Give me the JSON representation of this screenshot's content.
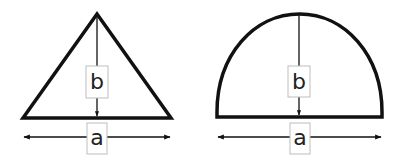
{
  "diagram": {
    "colors": {
      "stroke": "#111111",
      "label_box_border": "#bdbdbd",
      "label_text": "#222222",
      "background": "#ffffff"
    },
    "shapes": [
      {
        "id": "triangle",
        "kind": "triangle",
        "height_label": "b",
        "width_label": "a"
      },
      {
        "id": "semi-ellipse",
        "kind": "half-ellipse",
        "height_label": "b",
        "width_label": "a"
      }
    ]
  }
}
